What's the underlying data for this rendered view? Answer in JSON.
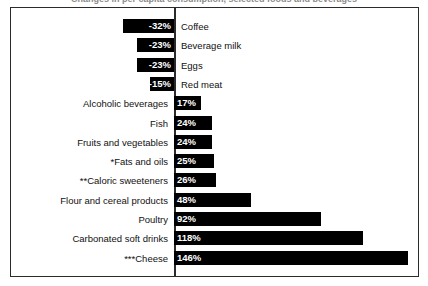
{
  "title": "Changes in per capita consumption, selected foods and beverages",
  "chart_data": {
    "type": "bar",
    "orientation": "horizontal",
    "title": "Changes in per capita consumption, selected foods and beverages",
    "xlabel": "",
    "ylabel": "",
    "grid": false,
    "legend": null,
    "zero_axis": true,
    "xlim": [
      -40,
      150
    ],
    "value_suffix": "%",
    "categories": [
      "Coffee",
      "Beverage milk",
      "Eggs",
      "Red meat",
      "Alcoholic beverages",
      "Fish",
      "Fruits and vegetables",
      "*Fats and oils",
      "**Caloric sweeteners",
      "Flour and cereal products",
      "Poultry",
      "Carbonated soft drinks",
      "***Cheese"
    ],
    "values": [
      -32,
      -23,
      -23,
      -15,
      17,
      24,
      24,
      25,
      26,
      48,
      92,
      118,
      146
    ],
    "labels": [
      "-32%",
      "-23%",
      "-23%",
      "-15%",
      "17%",
      "24%",
      "24%",
      "25%",
      "26%",
      "48%",
      "92%",
      "118%",
      "146%"
    ]
  },
  "colors": {
    "bar": "#000000",
    "bar_value_text": "#ffffff",
    "category_text": "#111111",
    "axis": "#2b2b2b",
    "frame": "#2b2b2b",
    "background": "#ffffff"
  }
}
